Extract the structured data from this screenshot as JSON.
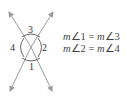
{
  "diagram": {
    "type": "vertical-angles",
    "angle_labels": [
      "1",
      "2",
      "3",
      "4"
    ],
    "colors": {
      "lines": "#9a9a9a",
      "arcs": "#555555",
      "text": "#333333"
    }
  },
  "equations": [
    {
      "lhs_m": "m",
      "lhs": "∠1",
      "eq": " = ",
      "rhs_m": "m",
      "rhs": "∠3"
    },
    {
      "lhs_m": "m",
      "lhs": "∠2",
      "eq": " = ",
      "rhs_m": "m",
      "rhs": "∠4"
    }
  ]
}
